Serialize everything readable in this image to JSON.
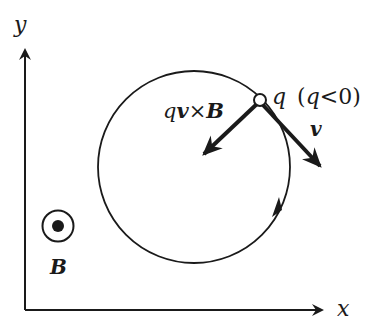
{
  "diagram": {
    "type": "physics-diagram",
    "axes": {
      "x_label": "x",
      "y_label": "y"
    },
    "field": {
      "symbol": "dot-in-circle (out of page)",
      "label": "B"
    },
    "charge": {
      "label_q": "q",
      "condition_open": "(",
      "condition_q": "q",
      "condition_op": "<",
      "condition_val": "0",
      "condition_close": ")"
    },
    "force_label": {
      "q": "q",
      "v": "v",
      "times": "×",
      "B": "B"
    },
    "velocity_label": "v",
    "orbit_direction": "clockwise",
    "colors": {
      "ink": "#1a1a1a",
      "background": "#ffffff"
    }
  }
}
